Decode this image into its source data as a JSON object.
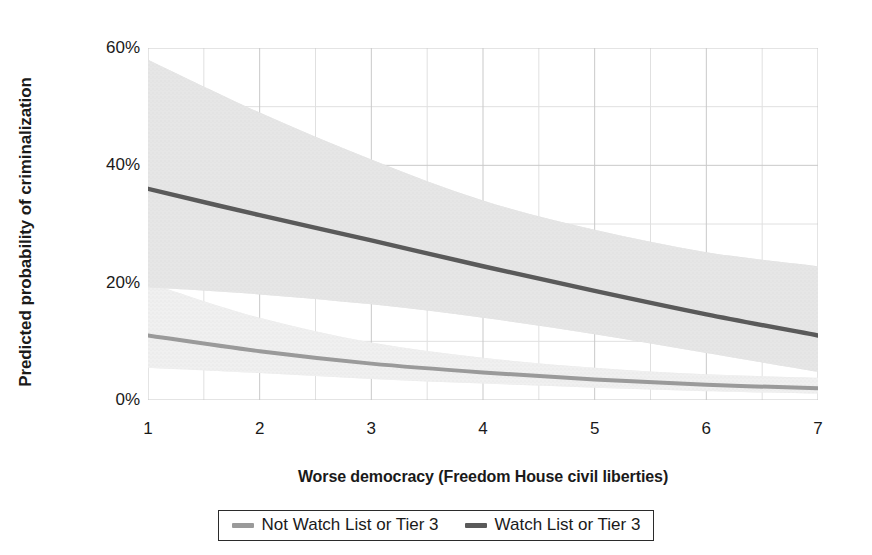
{
  "chart_data": {
    "type": "line",
    "title": "",
    "xlabel": "Worse democracy (Freedom House civil liberties)",
    "ylabel": "Predicted probability of criminalization",
    "xlim": [
      1,
      7
    ],
    "ylim": [
      0,
      0.6
    ],
    "grid": true,
    "grid_minor": true,
    "legend_position": "bottom-center",
    "x_ticks": [
      {
        "value": 1,
        "label": "1"
      },
      {
        "value": 2,
        "label": "2"
      },
      {
        "value": 3,
        "label": "3"
      },
      {
        "value": 4,
        "label": "4"
      },
      {
        "value": 5,
        "label": "5"
      },
      {
        "value": 6,
        "label": "6"
      },
      {
        "value": 7,
        "label": "7"
      }
    ],
    "x_minor_ticks": [
      1.5,
      2.5,
      3.5,
      4.5,
      5.5,
      6.5
    ],
    "y_ticks": [
      {
        "value": 0.0,
        "label": "0%"
      },
      {
        "value": 0.2,
        "label": "20%"
      },
      {
        "value": 0.4,
        "label": "40%"
      },
      {
        "value": 0.6,
        "label": "60%"
      }
    ],
    "y_minor_ticks": [
      0.1,
      0.3,
      0.5
    ],
    "x": [
      1,
      2,
      3,
      4,
      5,
      6,
      7
    ],
    "series": [
      {
        "name": "Not Watch List or Tier 3",
        "color": "#9a9a9a",
        "band_color": "#e3e3e3",
        "values": [
          0.11,
          0.083,
          0.062,
          0.047,
          0.035,
          0.026,
          0.02
        ],
        "ci_upper": [
          0.2,
          0.14,
          0.098,
          0.072,
          0.055,
          0.044,
          0.038
        ],
        "ci_lower": [
          0.055,
          0.046,
          0.036,
          0.028,
          0.021,
          0.015,
          0.011
        ]
      },
      {
        "name": "Watch List or Tier 3",
        "color": "#5a5a5a",
        "band_color": "#d2d2d2",
        "values": [
          0.36,
          0.315,
          0.272,
          0.228,
          0.186,
          0.146,
          0.11
        ],
        "ci_upper": [
          0.58,
          0.49,
          0.41,
          0.34,
          0.29,
          0.252,
          0.228
        ],
        "ci_lower": [
          0.192,
          0.18,
          0.163,
          0.14,
          0.112,
          0.08,
          0.048
        ]
      }
    ],
    "legend": [
      {
        "label": "Not Watch List or Tier 3",
        "color": "#9a9a9a"
      },
      {
        "label": "Watch List or Tier 3",
        "color": "#5a5a5a"
      }
    ],
    "colors": {
      "grid_major": "#c9c9c9",
      "grid_minor": "#e0e0e0",
      "text": "#1a1a1a",
      "legend_border": "#2b2b2b",
      "background": "#ffffff"
    }
  }
}
